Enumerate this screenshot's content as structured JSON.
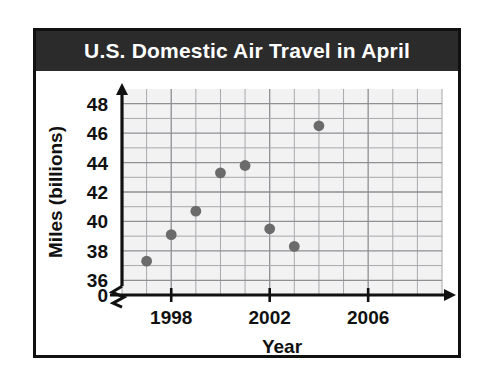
{
  "card": {
    "title": "U.S. Domestic Air Travel in April"
  },
  "chart_data": {
    "type": "scatter",
    "title": "U.S. Domestic Air Travel in April",
    "xlabel": "Year",
    "ylabel": "Miles (billions)",
    "x": [
      1997,
      1998,
      1999,
      2000,
      2001,
      2002,
      2003,
      2004
    ],
    "values": [
      37.3,
      39.1,
      40.7,
      43.3,
      43.8,
      39.5,
      38.3,
      46.5
    ],
    "series": [
      {
        "name": "Miles (billions)",
        "points": [
          {
            "x": 1997,
            "y": 37.3
          },
          {
            "x": 1998,
            "y": 39.1
          },
          {
            "x": 1999,
            "y": 40.7
          },
          {
            "x": 2000,
            "y": 43.3
          },
          {
            "x": 2001,
            "y": 43.8
          },
          {
            "x": 2002,
            "y": 39.5
          },
          {
            "x": 2003,
            "y": 38.3
          },
          {
            "x": 2004,
            "y": 46.5
          }
        ]
      }
    ],
    "xlim": [
      1996,
      2009
    ],
    "ylim": [
      35,
      49
    ],
    "y_ticks": [
      36,
      38,
      40,
      42,
      44,
      46,
      48
    ],
    "y_tick_labels": [
      "36",
      "38",
      "40",
      "42",
      "44",
      "46",
      "48"
    ],
    "y_origin_label": "0",
    "y_axis_break": true,
    "x_ticks": [
      1998,
      2002,
      2006
    ],
    "x_tick_labels": [
      "1998",
      "2002",
      "2006"
    ],
    "grid": true,
    "legend": "none",
    "marker_color": "#6b6b6b",
    "grid_color": "#a9a9ad",
    "title_bg": "#2b2b2b",
    "title_fg": "#ffffff"
  }
}
